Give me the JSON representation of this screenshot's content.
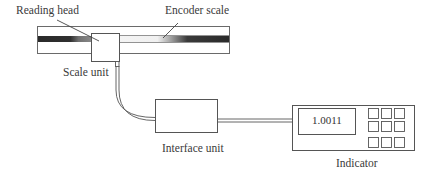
{
  "labels": {
    "reading_head": "Reading head",
    "encoder_scale": "Encoder scale",
    "scale_unit": "Scale unit",
    "interface_unit": "Interface unit",
    "indicator": "Indicator"
  },
  "indicator": {
    "display_value": "1.0011",
    "button_grid": {
      "rows": 3,
      "cols": 3
    }
  },
  "colors": {
    "stroke": "#5a5a5a",
    "scale_band_dark": "#2a2a2a",
    "background": "#ffffff"
  }
}
